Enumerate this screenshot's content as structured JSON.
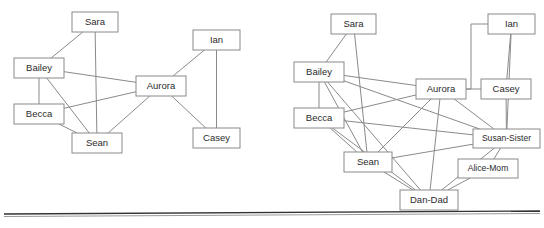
{
  "figure": {
    "type": "node-link-diagram",
    "panel_count": 2,
    "width": 544,
    "height": 228,
    "background_color": "#ffffff",
    "node_fill_color": "#ffffff",
    "node_stroke_color": "#8a8a8a",
    "edge_color": "#8a8a8a",
    "label_color": "#2b2b2b",
    "divider_color": "#333333"
  },
  "panels": [
    {
      "id": "left-graph",
      "name": "left-network-diagram",
      "nodes": [
        {
          "id": "sara",
          "label": "Sara",
          "x": 72,
          "y": 12,
          "w": 46,
          "h": 20
        },
        {
          "id": "bailey",
          "label": "Bailey",
          "x": 14,
          "y": 58,
          "w": 50,
          "h": 20
        },
        {
          "id": "becca",
          "label": "Becca",
          "x": 14,
          "y": 104,
          "w": 50,
          "h": 20
        },
        {
          "id": "sean",
          "label": "Sean",
          "x": 72,
          "y": 133,
          "w": 50,
          "h": 20
        },
        {
          "id": "aurora",
          "label": "Aurora",
          "x": 136,
          "y": 76,
          "w": 50,
          "h": 20
        },
        {
          "id": "ian",
          "label": "Ian",
          "x": 193,
          "y": 30,
          "w": 47,
          "h": 20
        },
        {
          "id": "casey",
          "label": "Casey",
          "x": 193,
          "y": 128,
          "w": 47,
          "h": 20
        }
      ],
      "edges": [
        {
          "from": "sara",
          "to": "bailey"
        },
        {
          "from": "sara",
          "to": "sean"
        },
        {
          "from": "bailey",
          "to": "becca"
        },
        {
          "from": "bailey",
          "to": "sean"
        },
        {
          "from": "bailey",
          "to": "aurora"
        },
        {
          "from": "becca",
          "to": "sean"
        },
        {
          "from": "becca",
          "to": "aurora"
        },
        {
          "from": "sean",
          "to": "aurora"
        },
        {
          "from": "aurora",
          "to": "ian"
        },
        {
          "from": "aurora",
          "to": "casey"
        },
        {
          "from": "ian",
          "to": "casey"
        }
      ]
    },
    {
      "id": "right-graph",
      "name": "right-network-diagram",
      "nodes": [
        {
          "id": "sara",
          "label": "Sara",
          "x": 331,
          "y": 14,
          "w": 45,
          "h": 20
        },
        {
          "id": "bailey",
          "label": "Bailey",
          "x": 294,
          "y": 62,
          "w": 50,
          "h": 20
        },
        {
          "id": "becca",
          "label": "Becca",
          "x": 294,
          "y": 108,
          "w": 50,
          "h": 20
        },
        {
          "id": "sean",
          "label": "Sean",
          "x": 344,
          "y": 152,
          "w": 48,
          "h": 20
        },
        {
          "id": "aurora",
          "label": "Aurora",
          "x": 416,
          "y": 79,
          "w": 50,
          "h": 20
        },
        {
          "id": "ian",
          "label": "Ian",
          "x": 488,
          "y": 14,
          "w": 47,
          "h": 20
        },
        {
          "id": "casey",
          "label": "Casey",
          "x": 481,
          "y": 79,
          "w": 50,
          "h": 20
        },
        {
          "id": "susan-sister",
          "label": "Susan-Sister",
          "x": 473,
          "y": 129,
          "w": 67,
          "h": 19
        },
        {
          "id": "alice-mom",
          "label": "Alice-Mom",
          "x": 458,
          "y": 159,
          "w": 60,
          "h": 19
        },
        {
          "id": "dan-dad",
          "label": "Dan-Dad",
          "x": 400,
          "y": 190,
          "w": 58,
          "h": 20
        }
      ],
      "edges": [
        {
          "from": "sara",
          "to": "bailey"
        },
        {
          "from": "sara",
          "to": "sean"
        },
        {
          "from": "bailey",
          "to": "becca"
        },
        {
          "from": "bailey",
          "to": "sean"
        },
        {
          "from": "bailey",
          "to": "aurora"
        },
        {
          "from": "bailey",
          "to": "susan-sister"
        },
        {
          "from": "bailey",
          "to": "dan-dad"
        },
        {
          "from": "becca",
          "to": "sean"
        },
        {
          "from": "becca",
          "to": "aurora"
        },
        {
          "from": "becca",
          "to": "susan-sister"
        },
        {
          "from": "becca",
          "to": "dan-dad"
        },
        {
          "from": "sean",
          "to": "aurora"
        },
        {
          "from": "sean",
          "to": "susan-sister"
        },
        {
          "from": "sean",
          "to": "dan-dad"
        },
        {
          "from": "aurora",
          "to": "casey"
        },
        {
          "from": "aurora",
          "to": "susan-sister"
        },
        {
          "from": "aurora",
          "to": "dan-dad"
        },
        {
          "from": "ian",
          "to": "casey"
        },
        {
          "from": "ian",
          "to": "susan-sister"
        },
        {
          "from": "ian",
          "to": "aurora"
        },
        {
          "from": "casey",
          "to": "susan-sister"
        },
        {
          "from": "susan-sister",
          "to": "alice-mom"
        },
        {
          "from": "susan-sister",
          "to": "dan-dad"
        },
        {
          "from": "alice-mom",
          "to": "dan-dad"
        }
      ]
    }
  ],
  "divider": {
    "name": "horizontal-rule",
    "y": 214
  }
}
